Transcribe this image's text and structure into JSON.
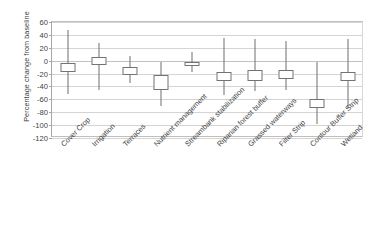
{
  "chart_data": {
    "type": "box",
    "title": "",
    "xlabel": "",
    "ylabel": "Percentage change from baseline",
    "ylim": [
      -120,
      60
    ],
    "ytick_step": 20,
    "yticks": [
      60,
      40,
      20,
      0,
      -20,
      -40,
      -60,
      -80,
      -100,
      -120
    ],
    "ytick_labels": [
      "60",
      "40",
      "20",
      "0",
      "-20",
      "-40",
      "-60",
      "-80",
      "-100",
      "-120"
    ],
    "grid": true,
    "grid_axis": "y",
    "legend": "none",
    "categories": [
      "Cover Crop",
      "Irrigation",
      "Terraces",
      "Nutrient management",
      "Streambank stabilization",
      "Riparian forest buffer",
      "Grassed waterways",
      "Filter Strip",
      "Contour Buffer Strip",
      "Wetland"
    ],
    "boxes": [
      {
        "category": "Cover Crop",
        "whisker_low": -52,
        "q1": -17,
        "q3": -4,
        "whisker_high": 48
      },
      {
        "category": "Irrigation",
        "whisker_low": -45,
        "q1": -6,
        "q3": 5,
        "whisker_high": 28
      },
      {
        "category": "Terraces",
        "whisker_low": -34,
        "q1": -22,
        "q3": -10,
        "whisker_high": 7
      },
      {
        "category": "Nutrient management",
        "whisker_low": -71,
        "q1": -45,
        "q3": -23,
        "whisker_high": -2
      },
      {
        "category": "Streambank stabilization",
        "whisker_low": -18,
        "q1": -8,
        "q3": -2,
        "whisker_high": 13
      },
      {
        "category": "Riparian forest buffer",
        "whisker_low": -53,
        "q1": -32,
        "q3": -18,
        "whisker_high": 35
      },
      {
        "category": "Grassed waterways",
        "whisker_low": -47,
        "q1": -31,
        "q3": -15,
        "whisker_high": 34
      },
      {
        "category": "Filter Strip",
        "whisker_low": -45,
        "q1": -29,
        "q3": -15,
        "whisker_high": 31
      },
      {
        "category": "Contour Buffer Strip",
        "whisker_low": -99,
        "q1": -73,
        "q3": -59,
        "whisker_high": -2
      },
      {
        "category": "Wetland",
        "whisker_low": -73,
        "q1": -32,
        "q3": -17,
        "whisker_high": 33
      }
    ]
  },
  "caption": ""
}
